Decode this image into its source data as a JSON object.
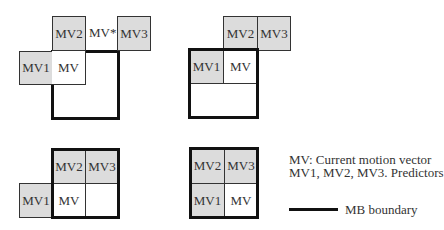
{
  "figure": {
    "diagrams": [
      {
        "id": "case-a",
        "cells": {
          "mv2": "MV2",
          "mv3": "MV3",
          "mv1": "MV1",
          "mv": "MV"
        },
        "extra_label": "MV*"
      },
      {
        "id": "case-b",
        "cells": {
          "mv2": "MV2",
          "mv3": "MV3",
          "mv1": "MV1",
          "mv": "MV"
        }
      },
      {
        "id": "case-c",
        "cells": {
          "mv2": "MV2",
          "mv3": "MV3",
          "mv1": "MV1",
          "mv": "MV"
        }
      },
      {
        "id": "case-d",
        "cells": {
          "mv2": "MV2",
          "mv3": "MV3",
          "mv1": "MV1",
          "mv": "MV"
        }
      }
    ],
    "legend": {
      "line1": "MV: Current motion vector",
      "line2": "MV1, MV2, MV3. Predictors",
      "boundary_label": "MB boundary"
    },
    "colors": {
      "predictor_fill": "#dcdcdc",
      "current_fill": "#ffffff",
      "mb_boundary": "#111111"
    }
  }
}
